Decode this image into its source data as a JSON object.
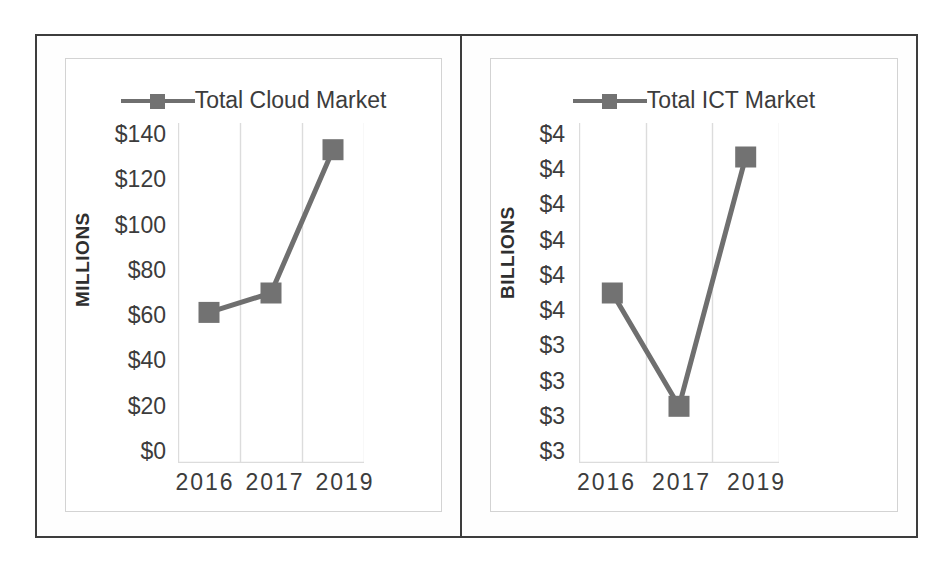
{
  "figure": {
    "border_color": "#3d3d3d",
    "background": "#ffffff",
    "series_color": "#6f6f6f",
    "marker_color": "#727272",
    "gridline_color": "#dcdcdc"
  },
  "chart_data": [
    {
      "type": "line",
      "panel": "left",
      "title": "",
      "legend": [
        "Total Cloud Market"
      ],
      "legend_position": "top-center",
      "series": [
        {
          "name": "Total Cloud Market",
          "values": [
            62,
            70,
            129
          ]
        }
      ],
      "categories": [
        "2016",
        "2017",
        "2019"
      ],
      "xlabel": "",
      "ylabel": "MILLIONS",
      "ylim": [
        0,
        140
      ],
      "ytick_labels": [
        "$140",
        "$120",
        "$100",
        "$80",
        "$60",
        "$40",
        "$20",
        "$0"
      ],
      "ytick_values": [
        140,
        120,
        100,
        80,
        60,
        40,
        20,
        0
      ],
      "xtick_labels": [
        "2016",
        "2017",
        "2019"
      ],
      "grid": "vertical",
      "marker": "square"
    },
    {
      "type": "line",
      "panel": "right",
      "title": "",
      "legend": [
        "Total ICT Market"
      ],
      "legend_position": "top-center",
      "series": [
        {
          "name": "Total ICT Market",
          "values": [
            3.85,
            3.35,
            4.45
          ]
        }
      ],
      "categories": [
        "2016",
        "2017",
        "2019"
      ],
      "xlabel": "",
      "ylabel": "BILLIONS",
      "ylim": [
        3.1,
        4.6
      ],
      "ytick_labels": [
        "$4",
        "$4",
        "$4",
        "$4",
        "$4",
        "$4",
        "$3",
        "$3",
        "$3",
        "$3"
      ],
      "ytick_values": [
        4.6,
        4.45,
        4.3,
        4.15,
        4.0,
        3.85,
        3.7,
        3.55,
        3.4,
        3.25
      ],
      "xtick_labels": [
        "2016",
        "2017",
        "2019"
      ],
      "grid": "vertical",
      "marker": "square"
    }
  ]
}
